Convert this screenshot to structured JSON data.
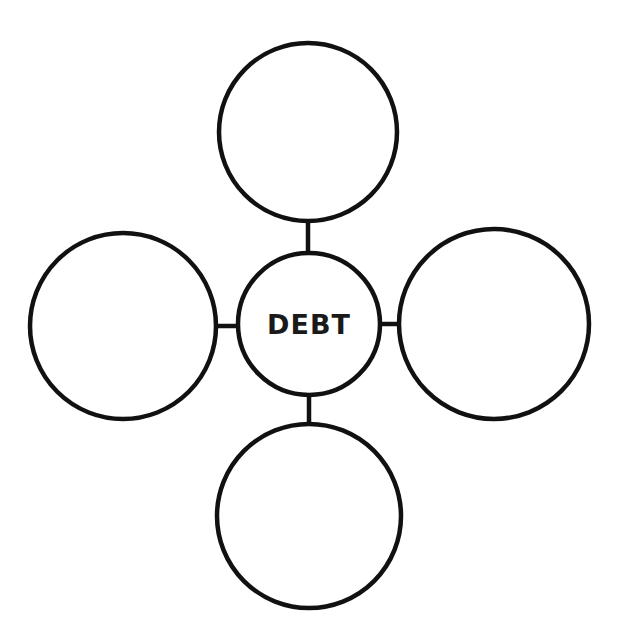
{
  "diagram": {
    "type": "concept-map",
    "stroke_color": "#111111",
    "background": "#ffffff",
    "center": {
      "label": "DEBT",
      "cx": 309,
      "cy": 324,
      "r": 71
    },
    "satellites": [
      {
        "id": "top",
        "label": "",
        "cx": 308,
        "cy": 132,
        "r": 89
      },
      {
        "id": "left",
        "label": "",
        "cx": 123,
        "cy": 326,
        "r": 93
      },
      {
        "id": "right",
        "label": "",
        "cx": 494,
        "cy": 324,
        "r": 95
      },
      {
        "id": "bottom",
        "label": "",
        "cx": 309,
        "cy": 516,
        "r": 92
      }
    ]
  }
}
